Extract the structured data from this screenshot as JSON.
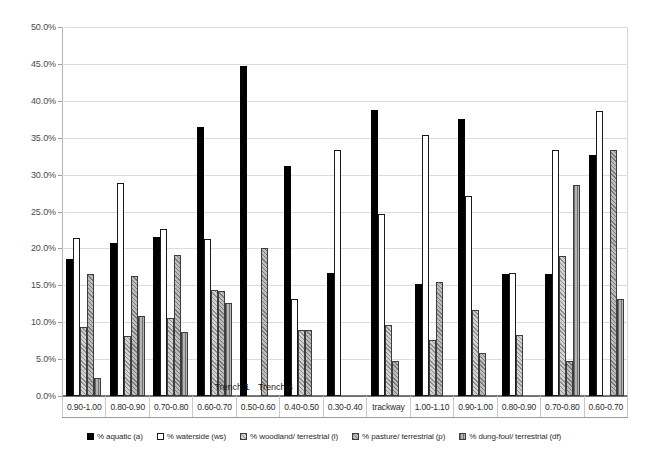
{
  "chart_data": {
    "type": "bar",
    "title": "",
    "subtitle": "",
    "xlabel": "",
    "ylabel": "",
    "ylim": [
      0,
      50
    ],
    "ytick_labels": [
      "0.0%",
      "5.0%",
      "10.0%",
      "15.0%",
      "20.0%",
      "25.0%",
      "30.0%",
      "35.0%",
      "40.0%",
      "45.0%",
      "50.0%"
    ],
    "ytick_values": [
      0,
      5,
      10,
      15,
      20,
      25,
      30,
      35,
      40,
      45,
      50
    ],
    "grid": "horizontal",
    "legend_position": "bottom",
    "categories": [
      "0.90-1.00",
      "0.80-0.90",
      "0.70-0.80",
      "0.60-0.70",
      "0.50-0.60",
      "0.40-0.50",
      "0.30-0.40",
      "trackway",
      "1.00-1.10",
      "0.90-1.00",
      "0.80-0.90",
      "0.70-0.80",
      "0.60-0.70"
    ],
    "group_labels": [
      {
        "label": "Trench 1",
        "spans": [
          "0.90-1.00",
          "0.80-0.90",
          "0.70-0.80",
          "0.60-0.70",
          "0.50-0.60",
          "0.40-0.50",
          "0.30-0.40"
        ]
      },
      {
        "label": "Trench 4",
        "spans": [
          "1.00-1.10",
          "0.90-1.00",
          "0.80-0.90",
          "0.70-0.80",
          "0.60-0.70"
        ]
      }
    ],
    "series": [
      {
        "name": "% aquatic (a)",
        "key": "a",
        "style": "solid-black",
        "values": [
          18.6,
          20.7,
          21.5,
          36.4,
          44.7,
          31.1,
          16.7,
          38.7,
          15.2,
          37.5,
          16.6,
          16.6,
          32.6
        ]
      },
      {
        "name": "% waterside (ws)",
        "key": "ws",
        "style": "white-outline",
        "values": [
          21.4,
          28.8,
          22.6,
          21.3,
          null,
          13.1,
          33.4,
          24.6,
          35.4,
          27.1,
          16.7,
          33.3,
          38.6
        ]
      },
      {
        "name": "% woodland/ terrestrial (l)",
        "key": "l",
        "style": "light-hatch",
        "values": [
          9.4,
          8.1,
          10.6,
          14.4,
          null,
          8.9,
          null,
          9.6,
          7.6,
          11.7,
          8.3,
          19.0,
          null
        ]
      },
      {
        "name": "% pasture/ terrestrial (p)",
        "key": "p",
        "style": "gray-hatch",
        "values": [
          16.6,
          16.2,
          19.1,
          14.2,
          20.1,
          8.9,
          null,
          4.8,
          15.4,
          5.8,
          null,
          4.8,
          33.3
        ]
      },
      {
        "name": "% dung-foul/ terrestrial (df)",
        "key": "df",
        "style": "gray-vertical",
        "values": [
          2.4,
          10.8,
          8.7,
          12.6,
          null,
          null,
          null,
          null,
          null,
          null,
          null,
          28.6,
          13.2
        ]
      }
    ],
    "colors": {
      "aquatic": "#000000",
      "waterside": "#ffffff",
      "woodland": "#d2d2d2",
      "pasture": "#bdbdbd",
      "dung_foul": "#b5b5b5",
      "grid": "#dcdcdc",
      "axis": "#6e6e6e",
      "text": "#2b2b2b"
    }
  }
}
